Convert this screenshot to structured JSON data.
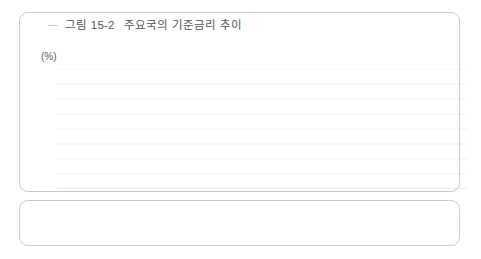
{
  "figure": {
    "number": "그림 15-2",
    "title": "주요국의 기준금리 추이",
    "unit_label": "(%)"
  },
  "chart_data": {
    "type": "line",
    "title": "주요국의 기준금리 추이",
    "xlabel": "",
    "ylabel": "(%)",
    "ylim": [
      0,
      8
    ],
    "yticks": [
      0,
      1,
      2,
      3,
      4,
      5,
      6,
      7,
      8
    ],
    "grid": true,
    "legend_position": "bottom",
    "categories": [
      "2000",
      "2001",
      "2002",
      "2003",
      "2004",
      "2005",
      "2006",
      "2007",
      "2008",
      "2009",
      "2010",
      "2011",
      "2012",
      "2013",
      "2014",
      "2015"
    ],
    "series": [
      {
        "name": "한국(기준금리)",
        "color": "#d2d2d2",
        "marker": "square",
        "values": [
          5.25,
          4.0,
          4.25,
          3.75,
          3.25,
          3.75,
          4.5,
          5.0,
          3.0,
          2.0,
          2.5,
          3.25,
          2.75,
          2.5,
          2.0,
          1.5
        ]
      },
      {
        "name": "미국(Fed Fund Rate)",
        "color": "#9a9a9a",
        "marker": "none",
        "values": [
          6.5,
          1.75,
          1.25,
          1.0,
          2.25,
          4.25,
          5.25,
          4.25,
          0.25,
          0.25,
          0.25,
          0.25,
          0.25,
          0.25,
          0.25,
          0.5
        ]
      },
      {
        "name": "유로(Refinancing Rate)",
        "color": "#2b2b2b",
        "marker": "diamond",
        "values": [
          4.75,
          3.25,
          2.75,
          2.0,
          2.0,
          2.25,
          3.5,
          4.0,
          2.5,
          1.0,
          1.0,
          1.0,
          0.75,
          0.25,
          0.05,
          0.05
        ]
      },
      {
        "name": "일본(Overnight Call Rate)",
        "color": "#6f6f6f",
        "marker": "square",
        "values": [
          0.25,
          0.0,
          0.0,
          0.0,
          0.0,
          0.0,
          0.25,
          0.5,
          0.1,
          0.1,
          0.1,
          0.1,
          0.1,
          0.1,
          0.1,
          0.1
        ]
      },
      {
        "name": "중국(1-year Lending Rate)",
        "color": "#c6c6c6",
        "marker": "square",
        "values": [
          5.85,
          5.85,
          5.3,
          5.3,
          5.6,
          5.6,
          6.1,
          7.5,
          5.3,
          5.3,
          5.8,
          6.5,
          6.0,
          6.0,
          5.6,
          4.35
        ]
      }
    ]
  },
  "legend": {
    "items": [
      {
        "label": "한국(기준금리)",
        "marker": "line-plain",
        "color": "#d2d2d2"
      },
      {
        "label": "미국(Fed Fund Rate)",
        "marker": "line-plain",
        "color": "#9a9a9a"
      },
      {
        "label": "유로(Refinancing Rate)",
        "marker": "line-markers",
        "color": "#2b2b2b"
      },
      {
        "label": "일본(Overnight Call Rate)",
        "marker": "line-markers",
        "color": "#6f6f6f"
      },
      {
        "label": "중국(1-year Lending Rate)",
        "marker": "line-markers",
        "color": "#c6c6c6"
      }
    ]
  }
}
